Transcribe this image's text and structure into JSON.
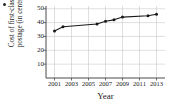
{
  "chart_data": {
    "type": "line",
    "title": "",
    "xlabel": "Year",
    "ylabel": "Cost of first-class postage (in cents)",
    "ylabel_line1": "Cost of first-class",
    "ylabel_line2": "postage (in cents)",
    "x": [
      2001,
      2002,
      2006,
      2007,
      2008,
      2009,
      2012,
      2013
    ],
    "values": [
      34,
      37,
      39,
      41,
      42,
      44,
      45,
      46
    ],
    "series": [
      {
        "name": "Cost of first-class postage",
        "values": [
          34,
          37,
          39,
          41,
          42,
          44,
          45,
          46
        ]
      }
    ],
    "points": [
      {
        "x": 2001,
        "y": 34
      },
      {
        "x": 2002,
        "y": 37
      },
      {
        "x": 2006,
        "y": 39
      },
      {
        "x": 2007,
        "y": 41
      },
      {
        "x": 2008,
        "y": 42
      },
      {
        "x": 2009,
        "y": 44
      },
      {
        "x": 2012,
        "y": 45
      },
      {
        "x": 2013,
        "y": 46
      }
    ],
    "xlim": [
      2000,
      2014
    ],
    "ylim": [
      0,
      52
    ],
    "xticks": [
      2001,
      2003,
      2005,
      2007,
      2009,
      2011,
      2013
    ],
    "xtick_labels": [
      "2001",
      "2003",
      "2005",
      "2007",
      "2009",
      "2011",
      "2013"
    ],
    "yticks": [
      10,
      20,
      30,
      40,
      50
    ],
    "ytick_labels": [
      "10",
      "20",
      "30",
      "40",
      "50"
    ],
    "grid": true,
    "legend": null,
    "line_color": "#1a1a1a",
    "marker_color": "#1a1a1a",
    "grid_color": "#c9c9c9",
    "axis_color": "#4a4a4a"
  }
}
